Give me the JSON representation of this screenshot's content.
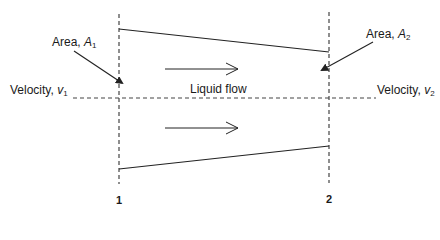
{
  "diagram": {
    "labels": {
      "area1": {
        "text": "Area, ",
        "symbol": "A",
        "sub": "1"
      },
      "area2": {
        "text": "Area, ",
        "symbol": "A",
        "sub": "2"
      },
      "velocity1": {
        "text": "Velocity, ",
        "symbol": "v",
        "sub": "1"
      },
      "velocity2": {
        "text": "Velocity, ",
        "symbol": "v",
        "sub": "2"
      },
      "flow": "Liquid flow",
      "section1": "1",
      "section2": "2"
    },
    "colors": {
      "line": "#222222",
      "dash": "#444444",
      "text": "#1a1a1a"
    }
  }
}
